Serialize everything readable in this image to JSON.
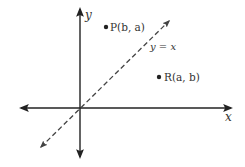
{
  "diagram": {
    "type": "coordinate-plane",
    "axes": {
      "x_label": "x",
      "y_label": "y"
    },
    "line": {
      "label": "y = x",
      "style": "dashed"
    },
    "points": [
      {
        "label": "P(b, a)"
      },
      {
        "label": "R(a, b)"
      }
    ],
    "colors": {
      "axis": "#222222",
      "dashed_line": "#444444",
      "text": "#333333"
    }
  }
}
